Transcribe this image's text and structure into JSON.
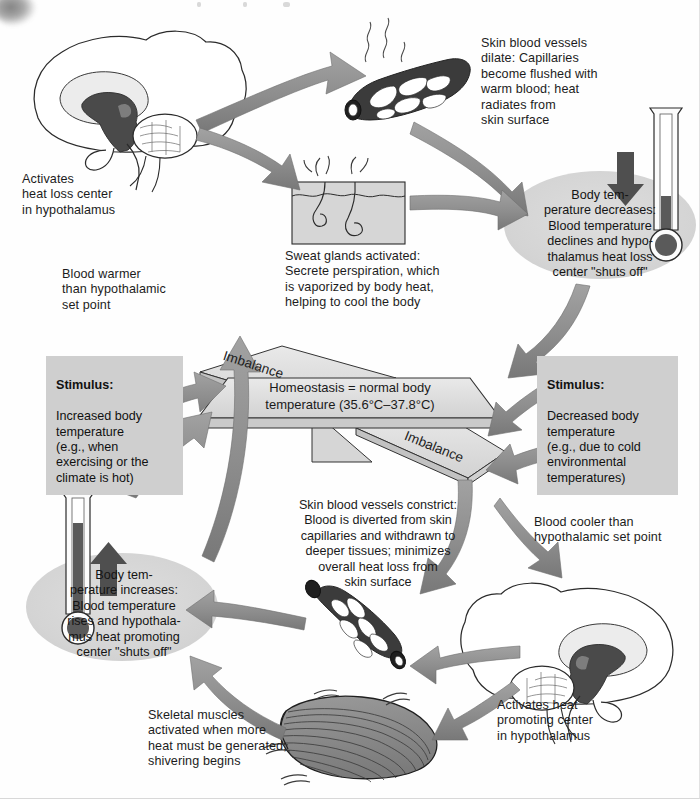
{
  "diagram": {
    "colors": {
      "arrow_gray": "#8f8f8f",
      "arrow_dark": "#6f6f6f",
      "oval_gray": "#d5d5d5",
      "stimulus_box": "#cfcfcf",
      "plank_fill": "#dcdcdc",
      "vessel_dark": "#3b3b3b",
      "muscle_gray": "#8a8a8a",
      "mercury": "#5a5a5a",
      "brain_shade": "#4a4a4a",
      "text": "#1c1c1c"
    },
    "center": {
      "balance_label": "Homeostasis = normal body\ntemperature (35.6°C–37.8°C)",
      "imbalance_top": "Imbalance",
      "imbalance_bottom": "Imbalance"
    },
    "stimulus_left": {
      "heading": "Stimulus:",
      "body": "Increased body\ntemperature\n(e.g., when\nexercising or the\nclimate is hot)"
    },
    "stimulus_right": {
      "heading": "Stimulus:",
      "body": "Decreased body\ntemperature\n(e.g., due to cold\nenvironmental\ntemperatures)"
    },
    "heat_loss_loop": {
      "blood_warmer": "Blood warmer\nthan hypothalamic\nset point",
      "activates_heat_loss": "Activates\nheat loss center\nin hypothalamus",
      "vessels_dilate": "Skin blood vessels\ndilate: Capillaries\nbecome flushed with\nwarm blood; heat\nradiates from\nskin surface",
      "sweat_glands": "Sweat glands activated:\nSecrete perspiration, which\nis vaporized by body heat,\nhelping to cool the body",
      "temp_decreases": "Body tem-\nperature decreases:\nBlood temperature\ndeclines and hypo-\nthalamus heat loss\ncenter \"shuts off\""
    },
    "heat_promoting_loop": {
      "blood_cooler": "Blood cooler than\nhypothalamic set point",
      "activates_heat_promoting": "Activates heat\npromoting center\nin hypothalamus",
      "vessels_constrict": "Skin blood vessels constrict:\nBlood is diverted from skin\ncapillaries and withdrawn to\ndeeper tissues; minimizes\noverall heat loss from\nskin surface",
      "skeletal_muscles": "Skeletal muscles\nactivated when more\nheat must be generated;\nshivering begins",
      "temp_increases": "Body tem-\nperature increases:\nBlood temperature\nrises and hypothala-\nmus heat promoting\ncenter \"shuts off\""
    },
    "icons": {
      "brain_top": "brain-sagittal-icon",
      "brain_bottom": "brain-sagittal-icon",
      "vessel_dilated": "dilated-capillary-bed-icon",
      "vessel_constricted": "constricted-capillary-bed-icon",
      "skin_sweat": "skin-sweat-gland-icon",
      "muscle": "skeletal-muscle-icon",
      "thermometer_down": "thermometer-falling-icon",
      "thermometer_up": "thermometer-rising-icon",
      "arrow_down": "down-arrow-icon",
      "arrow_up": "up-arrow-icon",
      "balance": "balance-scale-icon"
    }
  }
}
